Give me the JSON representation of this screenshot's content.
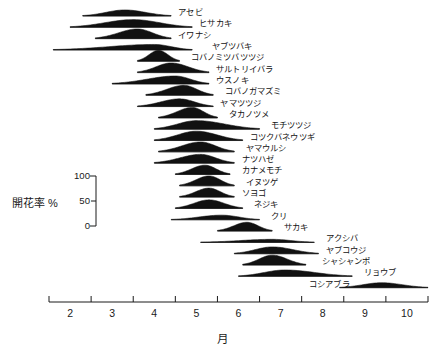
{
  "chart_data": {
    "type": "area",
    "title": "",
    "xlabel": "月",
    "ylabel": "開花率 %",
    "xlim": [
      1.5,
      10.5
    ],
    "ylim": [
      0,
      100
    ],
    "grid": false,
    "legend": "none",
    "xticks": [
      2,
      3,
      4,
      5,
      6,
      7,
      8,
      9,
      10
    ],
    "xtick_labels": [
      "2",
      "3",
      "4",
      "5",
      "6",
      "7",
      "8",
      "9",
      "10"
    ],
    "yticks": [
      0,
      50,
      100
    ],
    "ytick_labels": [
      "0",
      "50",
      "100"
    ],
    "note": "Each row is one species' flowering-rate (開花率 %) curve plotted against month (月); row heights are normalized 0-100%.",
    "series": [
      {
        "name": "アセビ",
        "start": 2.3,
        "peak": 3.3,
        "end": 4.4,
        "peak_height": 55,
        "label_x": 4.5
      },
      {
        "name": "ヒサカキ",
        "start": 2.0,
        "peak": 3.5,
        "end": 4.9,
        "peak_height": 70,
        "label_x": 5.0
      },
      {
        "name": "イワナシ",
        "start": 2.6,
        "peak": 3.6,
        "end": 4.4,
        "peak_height": 88,
        "label_x": 4.5
      },
      {
        "name": "ヤブツバキ",
        "start": 1.6,
        "peak": 4.0,
        "end": 4.9,
        "peak_height": 50,
        "label_x": 5.3
      },
      {
        "name": "コバノミツバツツジ",
        "start": 3.6,
        "peak": 4.1,
        "end": 4.6,
        "peak_height": 100,
        "label_x": 4.8
      },
      {
        "name": "サルトリイバラ",
        "start": 3.6,
        "peak": 4.4,
        "end": 5.3,
        "peak_height": 88,
        "label_x": 5.4
      },
      {
        "name": "ウスノキ",
        "start": 3.0,
        "peak": 4.5,
        "end": 5.3,
        "peak_height": 72,
        "label_x": 5.4
      },
      {
        "name": "コバノガマズミ",
        "start": 3.8,
        "peak": 4.7,
        "end": 5.4,
        "peak_height": 90,
        "label_x": 5.6
      },
      {
        "name": "ヤマツツジ",
        "start": 3.6,
        "peak": 4.6,
        "end": 5.4,
        "peak_height": 70,
        "label_x": 5.5
      },
      {
        "name": "タカノツメ",
        "start": 4.1,
        "peak": 4.9,
        "end": 5.5,
        "peak_height": 95,
        "label_x": 5.7
      },
      {
        "name": "モチツツジ",
        "start": 4.0,
        "peak": 5.0,
        "end": 6.5,
        "peak_height": 78,
        "label_x": 6.7
      },
      {
        "name": "コツクバネウツギ",
        "start": 4.0,
        "peak": 5.0,
        "end": 6.1,
        "peak_height": 85,
        "label_x": 6.2
      },
      {
        "name": "ヤマウルシ",
        "start": 4.1,
        "peak": 5.1,
        "end": 5.9,
        "peak_height": 90,
        "label_x": 6.1
      },
      {
        "name": "ナツハゼ",
        "start": 4.0,
        "peak": 5.1,
        "end": 5.9,
        "peak_height": 80,
        "label_x": 6.0
      },
      {
        "name": "カナメモチ",
        "start": 4.5,
        "peak": 5.2,
        "end": 5.8,
        "peak_height": 85,
        "label_x": 6.0
      },
      {
        "name": "イヌツゲ",
        "start": 4.6,
        "peak": 5.3,
        "end": 5.9,
        "peak_height": 90,
        "label_x": 6.1
      },
      {
        "name": "ソヨゴ",
        "start": 4.6,
        "peak": 5.3,
        "end": 5.9,
        "peak_height": 82,
        "label_x": 6.0
      },
      {
        "name": "ネジキ",
        "start": 4.5,
        "peak": 5.3,
        "end": 6.1,
        "peak_height": 78,
        "label_x": 6.3
      },
      {
        "name": "クリ",
        "start": 4.4,
        "peak": 5.6,
        "end": 6.5,
        "peak_height": 42,
        "label_x": 6.7
      },
      {
        "name": "サカキ",
        "start": 5.5,
        "peak": 6.2,
        "end": 6.8,
        "peak_height": 80,
        "label_x": 7.0
      },
      {
        "name": "アクシバ",
        "start": 5.1,
        "peak": 6.8,
        "end": 7.8,
        "peak_height": 28,
        "label_x": 8.0
      },
      {
        "name": "ヤブコウジ",
        "start": 5.9,
        "peak": 6.8,
        "end": 7.9,
        "peak_height": 62,
        "label_x": 8.0
      },
      {
        "name": "シャシャンポ",
        "start": 6.1,
        "peak": 6.8,
        "end": 7.6,
        "peak_height": 90,
        "label_x": 7.9
      },
      {
        "name": "リョウブ",
        "start": 6.0,
        "peak": 7.1,
        "end": 8.7,
        "peak_height": 58,
        "label_x": 8.9
      },
      {
        "name": "コシアブラ",
        "start": 8.4,
        "peak": 9.4,
        "end": 10.5,
        "peak_height": 45,
        "label_x": 7.5
      }
    ]
  },
  "yscale": {
    "name": "開花率 %",
    "ticks": [
      "100",
      "50",
      "0"
    ]
  },
  "axis": {
    "x_title": "月",
    "tick_labels": [
      "2",
      "3",
      "4",
      "5",
      "6",
      "7",
      "8",
      "9",
      "10"
    ]
  }
}
